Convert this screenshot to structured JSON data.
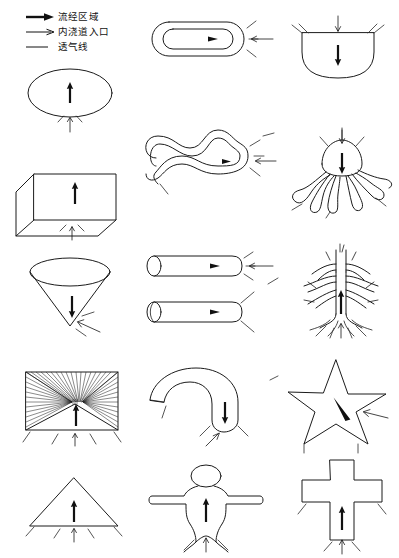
{
  "page": {
    "background_color": "#ffffff",
    "line_color": "#1b1b1b",
    "width": 399,
    "height": 558
  },
  "legend": {
    "name": "图例",
    "items": [
      {
        "symbol": "filled-arrow",
        "label": "流经区域"
      },
      {
        "symbol": "thin-arrow",
        "label": "内浇道入口"
      },
      {
        "symbol": "plain-line",
        "label": "透气线"
      }
    ]
  },
  "figures": [
    {
      "id": "ellipse",
      "row": 1,
      "col": 1,
      "name": "椭圆",
      "flow_direction": "up",
      "gate_position": "bottom",
      "vents": 2
    },
    {
      "id": "stadium",
      "row": 1,
      "col": 2,
      "name": "圆角环形",
      "flow_direction": "right",
      "gate_position": "right",
      "vents": 3
    },
    {
      "id": "tub",
      "row": 1,
      "col": 3,
      "name": "圆底容器",
      "flow_direction": "down",
      "gate_position": "top",
      "vents": 4
    },
    {
      "id": "box",
      "row": 2,
      "col": 1,
      "name": "立方体",
      "flow_direction": "up",
      "gate_position": "bottom",
      "vents": 2
    },
    {
      "id": "serpent",
      "row": 2,
      "col": 2,
      "name": "蛇形管",
      "flow_direction": "right",
      "gate_position": "right",
      "vents": 5
    },
    {
      "id": "octopus",
      "row": 2,
      "col": 3,
      "name": "章鱼形",
      "flow_direction": "down",
      "gate_position": "top",
      "vents": 6
    },
    {
      "id": "cone",
      "row": 3,
      "col": 1,
      "name": "倒锥",
      "flow_direction": "down",
      "gate_position": "bottom",
      "vents": 2
    },
    {
      "id": "cylinders",
      "row": 3,
      "col": 2,
      "name": "圆柱管",
      "flow_direction": "right",
      "gate_position": "right",
      "vents": 5
    },
    {
      "id": "tree",
      "row": 3,
      "col": 3,
      "name": "树形",
      "flow_direction": "up",
      "gate_position": "bottom",
      "vents": 5
    },
    {
      "id": "hatchbox",
      "row": 4,
      "col": 1,
      "name": "网格方框",
      "flow_direction": "up",
      "gate_position": "bottom",
      "vents": 4
    },
    {
      "id": "hook",
      "row": 4,
      "col": 2,
      "name": "弯钩形",
      "flow_direction": "down",
      "gate_position": "bottom",
      "vents": 4
    },
    {
      "id": "star",
      "row": 4,
      "col": 3,
      "name": "五角星",
      "flow_direction": "diagonal",
      "gate_position": "right",
      "vents": 2
    },
    {
      "id": "triangle",
      "row": 5,
      "col": 1,
      "name": "三角形",
      "flow_direction": "up",
      "gate_position": "bottom",
      "vents": 4
    },
    {
      "id": "person",
      "row": 5,
      "col": 2,
      "name": "人形",
      "flow_direction": "up",
      "gate_position": "bottom",
      "vents": 2
    },
    {
      "id": "cross",
      "row": 5,
      "col": 3,
      "name": "十字形",
      "flow_direction": "up",
      "gate_position": "bottom",
      "vents": 4
    }
  ]
}
